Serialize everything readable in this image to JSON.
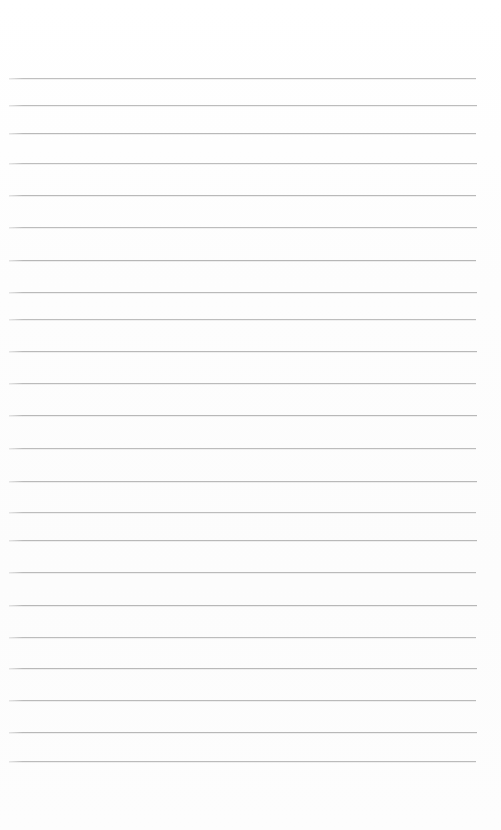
{
  "document": {
    "kind": "ruled-paper",
    "title": "Blank ruled notebook page",
    "page_width": 501,
    "page_height": 830,
    "background_color": "#fdfdfd",
    "visible_text": "",
    "header_text": "",
    "footer_text": "",
    "page_number": ""
  },
  "rules": {
    "color": "#b3b3b3",
    "thickness_px": 1,
    "line_start_x": 9,
    "line_end_x": 477,
    "count": 23,
    "top_margin_px": 78,
    "bottom_margin_px": 69,
    "lines": [
      {
        "y": 78,
        "x1": 9,
        "x2": 476,
        "opacity": 0.78
      },
      {
        "y": 105,
        "x1": 9,
        "x2": 477,
        "opacity": 0.82
      },
      {
        "y": 133,
        "x1": 9,
        "x2": 476,
        "opacity": 0.85
      },
      {
        "y": 163,
        "x1": 9,
        "x2": 477,
        "opacity": 0.8
      },
      {
        "y": 195,
        "x1": 9,
        "x2": 476,
        "opacity": 0.86
      },
      {
        "y": 227,
        "x1": 9,
        "x2": 477,
        "opacity": 0.82
      },
      {
        "y": 260,
        "x1": 9,
        "x2": 476,
        "opacity": 0.88
      },
      {
        "y": 292,
        "x1": 9,
        "x2": 477,
        "opacity": 0.84
      },
      {
        "y": 319,
        "x1": 9,
        "x2": 476,
        "opacity": 0.8
      },
      {
        "y": 351,
        "x1": 9,
        "x2": 477,
        "opacity": 0.86
      },
      {
        "y": 383,
        "x1": 9,
        "x2": 476,
        "opacity": 0.83
      },
      {
        "y": 415,
        "x1": 9,
        "x2": 477,
        "opacity": 0.87
      },
      {
        "y": 448,
        "x1": 9,
        "x2": 476,
        "opacity": 0.82
      },
      {
        "y": 481,
        "x1": 9,
        "x2": 477,
        "opacity": 0.85
      },
      {
        "y": 512,
        "x1": 9,
        "x2": 476,
        "opacity": 0.8
      },
      {
        "y": 540,
        "x1": 9,
        "x2": 477,
        "opacity": 0.86
      },
      {
        "y": 572,
        "x1": 9,
        "x2": 476,
        "opacity": 0.84
      },
      {
        "y": 605,
        "x1": 9,
        "x2": 477,
        "opacity": 0.88
      },
      {
        "y": 637,
        "x1": 9,
        "x2": 476,
        "opacity": 0.82
      },
      {
        "y": 668,
        "x1": 9,
        "x2": 477,
        "opacity": 0.86
      },
      {
        "y": 700,
        "x1": 9,
        "x2": 476,
        "opacity": 0.84
      },
      {
        "y": 732,
        "x1": 9,
        "x2": 477,
        "opacity": 0.87
      },
      {
        "y": 761,
        "x1": 9,
        "x2": 476,
        "opacity": 0.83
      }
    ]
  }
}
